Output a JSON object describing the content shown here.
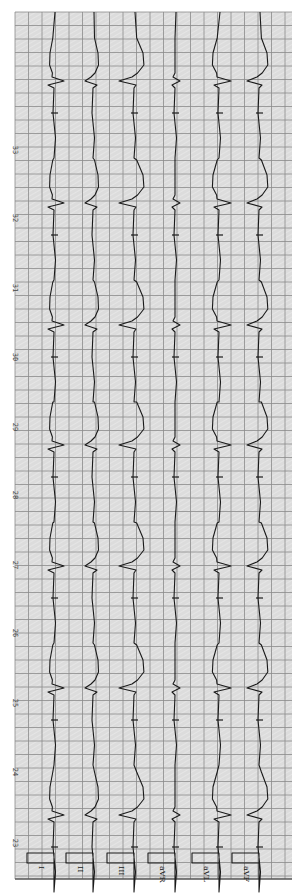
{
  "document": {
    "type": "ECG rhythm strip (rotated 90°, limb leads)",
    "paper": {
      "background": "#dcdcdc",
      "grid_color": "#8a8a8a",
      "trace_color": "#1a1a1a",
      "left": 15,
      "top": 12,
      "right": 292,
      "bottom": 879,
      "grid_spacing": 13.5
    },
    "time_markers": [
      {
        "label": "33",
        "y": 150
      },
      {
        "label": "32",
        "y": 218
      },
      {
        "label": "31",
        "y": 288
      },
      {
        "label": "30",
        "y": 357
      },
      {
        "label": "29",
        "y": 427
      },
      {
        "label": "28",
        "y": 495
      },
      {
        "label": "27",
        "y": 565
      },
      {
        "label": "26",
        "y": 633
      },
      {
        "label": "25",
        "y": 703
      },
      {
        "label": "24",
        "y": 772
      },
      {
        "label": "23",
        "y": 843
      }
    ],
    "beats_y": [
      83,
      205,
      327,
      447,
      568,
      690,
      817
    ],
    "leads": [
      {
        "name": "I",
        "baseline_x": 54,
        "qrs": [
          10,
          -6
        ],
        "t_wave": -4,
        "marker": true
      },
      {
        "name": "II",
        "baseline_x": 93,
        "qrs": [
          -8,
          4
        ],
        "t_wave": 5,
        "marker": false
      },
      {
        "name": "III",
        "baseline_x": 134,
        "qrs": [
          -15,
          2
        ],
        "t_wave": 9,
        "marker": true
      },
      {
        "name": "aVR",
        "baseline_x": 175,
        "qrs": [
          5,
          -3
        ],
        "t_wave": 0,
        "marker": true
      },
      {
        "name": "aVL",
        "baseline_x": 219,
        "qrs": [
          12,
          -5
        ],
        "t_wave": -6,
        "marker": true
      },
      {
        "name": "aVF",
        "baseline_x": 259,
        "qrs": [
          -12,
          3
        ],
        "t_wave": 8,
        "marker": true
      }
    ],
    "calibration": {
      "pulse_width": 27,
      "top_y": 853,
      "bottom_y": 863
    }
  }
}
